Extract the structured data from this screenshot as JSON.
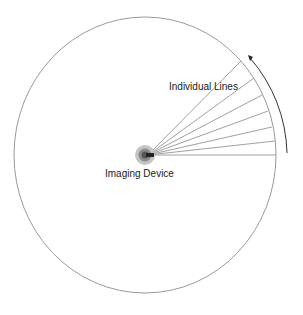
{
  "diagram": {
    "labels": {
      "lines": "Individual Lines",
      "device": "Imaging Device"
    },
    "colors": {
      "circle": "#9a9a9a",
      "lines": "#a0a0a0",
      "arrow": "#333333",
      "device_outer": "#b5b5b5",
      "device_inner": "#6a6a6a"
    }
  }
}
